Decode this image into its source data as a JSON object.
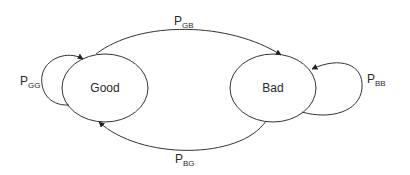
{
  "diagram": {
    "type": "state-transition",
    "states": [
      {
        "id": "good",
        "label": "Good"
      },
      {
        "id": "bad",
        "label": "Bad"
      }
    ],
    "transitions": [
      {
        "from": "good",
        "to": "good",
        "label_main": "P",
        "label_sub": "GG"
      },
      {
        "from": "good",
        "to": "bad",
        "label_main": "P",
        "label_sub": "GB"
      },
      {
        "from": "bad",
        "to": "good",
        "label_main": "P",
        "label_sub": "BG"
      },
      {
        "from": "bad",
        "to": "bad",
        "label_main": "P",
        "label_sub": "BB"
      }
    ],
    "colors": {
      "stroke": "#333333",
      "text": "#2a2a2a",
      "background": "#ffffff"
    }
  }
}
